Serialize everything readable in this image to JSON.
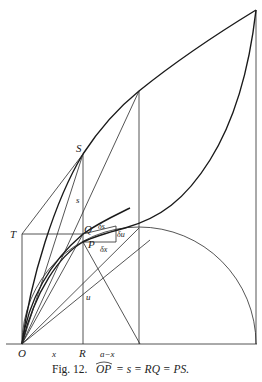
{
  "figure": {
    "caption": "Fig. 12. OP̂ = s = RQ = PS.",
    "caption_parts": {
      "prefix": "Fig. 12.",
      "arc": "OP",
      "rest": "= s = RQ = PS."
    }
  },
  "labels": {
    "S": "S",
    "T": "T",
    "Q": "Q",
    "P": "P",
    "O": "O",
    "R": "R",
    "s": "s",
    "u": "u",
    "x": "x",
    "a_minus_x": "a−x",
    "delta_s": "δs",
    "delta_u": "δu",
    "delta_x": "δx"
  },
  "points": {
    "O": [
      22,
      344
    ],
    "R": [
      83,
      344
    ],
    "T": [
      22,
      234
    ],
    "Q": [
      83,
      234
    ],
    "P": [
      83,
      242
    ],
    "S": [
      83,
      154
    ],
    "top_right": [
      256,
      10
    ],
    "circle_top": [
      139,
      228
    ],
    "upper_mid": [
      139,
      91
    ],
    "foot_of_P_line": [
      140,
      344
    ]
  },
  "colors": {
    "ink": "#222222",
    "background": "#ffffff"
  }
}
